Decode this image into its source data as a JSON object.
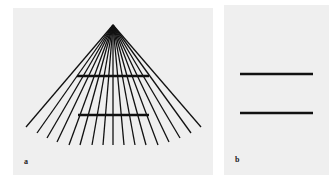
{
  "figure": {
    "panel_a": {
      "label": "a",
      "apex": [
        113,
        25
      ],
      "ray_ends": [
        [
          26,
          127
        ],
        [
          37,
          133
        ],
        [
          47,
          138
        ],
        [
          57,
          142
        ],
        [
          69,
          145
        ],
        [
          80,
          145
        ],
        [
          92,
          145
        ],
        [
          103,
          145
        ],
        [
          113,
          145
        ],
        [
          124,
          145
        ],
        [
          135,
          145
        ],
        [
          146,
          145
        ],
        [
          158,
          145
        ],
        [
          169,
          142
        ],
        [
          180,
          138
        ],
        [
          191,
          133
        ],
        [
          201,
          127
        ]
      ],
      "bars": [
        [
          77,
          76,
          149,
          76
        ],
        [
          78,
          115,
          149,
          115
        ]
      ]
    },
    "panel_b": {
      "label": "b",
      "bars": [
        [
          240,
          74,
          313,
          74
        ],
        [
          240,
          113,
          313,
          113
        ]
      ]
    },
    "colors": {
      "line": "#111111",
      "panel_bg": "#efefef"
    }
  }
}
